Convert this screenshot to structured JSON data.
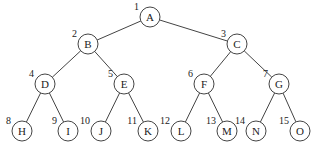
{
  "diagram": {
    "type": "complete-binary-tree",
    "node_radius": 10,
    "colors": {
      "stroke": "#444444",
      "text": "#222222",
      "background": "#ffffff"
    },
    "nodes": [
      {
        "id": "A",
        "label": "A",
        "index": "1",
        "x": 150,
        "y": 17,
        "parent": null
      },
      {
        "id": "B",
        "label": "B",
        "index": "2",
        "x": 88,
        "y": 44,
        "parent": "A"
      },
      {
        "id": "C",
        "label": "C",
        "index": "3",
        "x": 237,
        "y": 44,
        "parent": "A"
      },
      {
        "id": "D",
        "label": "D",
        "index": "4",
        "x": 45,
        "y": 84,
        "parent": "B"
      },
      {
        "id": "E",
        "label": "E",
        "index": "5",
        "x": 124,
        "y": 84,
        "parent": "B"
      },
      {
        "id": "F",
        "label": "F",
        "index": "6",
        "x": 204,
        "y": 84,
        "parent": "C"
      },
      {
        "id": "G",
        "label": "G",
        "index": "7",
        "x": 279,
        "y": 84,
        "parent": "C"
      },
      {
        "id": "H",
        "label": "H",
        "index": "8",
        "x": 22,
        "y": 131,
        "parent": "D"
      },
      {
        "id": "I",
        "label": "I",
        "index": "9",
        "x": 68,
        "y": 131,
        "parent": "D"
      },
      {
        "id": "J",
        "label": "J",
        "index": "10",
        "x": 101,
        "y": 131,
        "parent": "E"
      },
      {
        "id": "K",
        "label": "K",
        "index": "11",
        "x": 148,
        "y": 131,
        "parent": "E"
      },
      {
        "id": "L",
        "label": "L",
        "index": "12",
        "x": 181,
        "y": 131,
        "parent": "F"
      },
      {
        "id": "M",
        "label": "M",
        "index": "13",
        "x": 227,
        "y": 131,
        "parent": "F"
      },
      {
        "id": "N",
        "label": "N",
        "index": "14",
        "x": 256,
        "y": 131,
        "parent": "G"
      },
      {
        "id": "O",
        "label": "O",
        "index": "15",
        "x": 300,
        "y": 131,
        "parent": "G"
      }
    ]
  }
}
